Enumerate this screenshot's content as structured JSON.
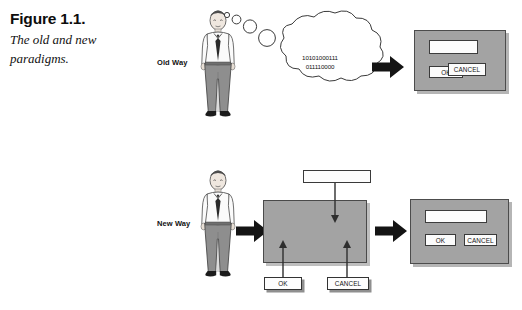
{
  "figure": {
    "number_label": "Figure 1.1.",
    "caption": "The old and new paradigms."
  },
  "rows": {
    "old": {
      "label": "Old Way",
      "person_icon": "businessman-figure-icon",
      "thought_icon": "thought-bubble-icon",
      "binary_line_1": "10101000111",
      "binary_line_2": "011110000",
      "arrow_icon": "block-arrow-right-icon",
      "dialog": {
        "name": "old-way-dialog",
        "field_value": "",
        "buttons": [
          {
            "label": "OK",
            "name": "ok-button"
          },
          {
            "label": "CANCEL",
            "name": "cancel-button"
          }
        ]
      }
    },
    "new": {
      "label": "New Way",
      "person_icon": "businessman-figure-icon",
      "arrow_icon": "block-arrow-right-icon",
      "canvas_name": "visual-design-canvas",
      "palette": [
        {
          "label": "",
          "name": "textfield-widget"
        },
        {
          "label": "OK",
          "name": "ok-widget"
        },
        {
          "label": "CANCEL",
          "name": "cancel-widget"
        }
      ],
      "result_arrow_icon": "block-arrow-right-icon",
      "dialog": {
        "name": "new-way-dialog",
        "field_value": "",
        "buttons": [
          {
            "label": "OK",
            "name": "ok-button"
          },
          {
            "label": "CANCEL",
            "name": "cancel-button"
          }
        ]
      }
    }
  },
  "colors": {
    "dialog_gray": "#a3a3a3",
    "dialog_border": "#4c4c4c",
    "widget_white": "#fdfdfd",
    "ink": "#111111",
    "arrow_black": "#111111"
  }
}
